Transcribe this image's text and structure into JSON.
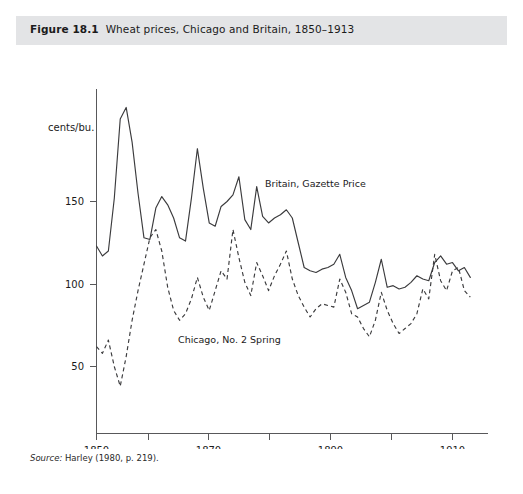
{
  "figure": {
    "number": "Figure 18.1",
    "caption": "Wheat prices, Chicago and Britain, 1850–1913",
    "source_label": "Source:",
    "source_text": " Harley (1980, p. 219)."
  },
  "labels": {
    "britain_series": "Britain, Gazette Price",
    "chicago_series": "Chicago, No. 2 Spring",
    "y_unit": "cents/bu."
  },
  "colors": {
    "header_band": "#e3e4e6",
    "panel_background": "#ffffff",
    "line": "#3b3b3d",
    "axis": "#58585a",
    "text": "#1b1b1b"
  },
  "chart_data": {
    "type": "line",
    "title": "Wheat prices, Chicago and Britain, 1850–1913",
    "xlabel": "",
    "ylabel": "cents/bu.",
    "xlim": [
      1850,
      1913
    ],
    "ylim": [
      25,
      215
    ],
    "grid": false,
    "legend_position": "inline-annotations",
    "xticks": [
      1850,
      1860,
      1870,
      1880,
      1890,
      1900,
      1910
    ],
    "xtick_labels": [
      "1850",
      "",
      "1870",
      "",
      "1890",
      "",
      "1910"
    ],
    "yticks": [
      50,
      100,
      150
    ],
    "ytick_labels": [
      "50",
      "100",
      "150"
    ],
    "x": [
      1850,
      1851,
      1852,
      1853,
      1854,
      1855,
      1856,
      1857,
      1858,
      1859,
      1860,
      1861,
      1862,
      1863,
      1864,
      1865,
      1866,
      1867,
      1868,
      1869,
      1870,
      1871,
      1872,
      1873,
      1874,
      1875,
      1876,
      1877,
      1878,
      1879,
      1880,
      1881,
      1882,
      1883,
      1884,
      1885,
      1886,
      1887,
      1888,
      1889,
      1890,
      1891,
      1892,
      1893,
      1894,
      1895,
      1896,
      1897,
      1898,
      1899,
      1900,
      1901,
      1902,
      1903,
      1904,
      1905,
      1906,
      1907,
      1908,
      1909,
      1910,
      1911,
      1912,
      1913
    ],
    "series": [
      {
        "name": "Britain, Gazette Price",
        "style": "solid",
        "values": [
          123,
          117,
          120,
          152,
          200,
          207,
          186,
          155,
          128,
          127,
          146,
          153,
          148,
          140,
          128,
          126,
          152,
          182,
          158,
          137,
          135,
          147,
          150,
          154,
          165,
          139,
          133,
          159,
          141,
          137,
          140,
          142,
          145,
          140,
          125,
          110,
          108,
          107,
          109,
          110,
          112,
          118,
          104,
          96,
          85,
          87,
          89,
          101,
          115,
          98,
          99,
          97,
          98,
          101,
          105,
          103,
          102,
          113,
          117,
          112,
          113,
          108,
          110,
          104
        ]
      },
      {
        "name": "Chicago, No. 2 Spring",
        "style": "dashed",
        "values": [
          62,
          58,
          66,
          50,
          38,
          56,
          78,
          96,
          112,
          128,
          133,
          120,
          98,
          84,
          78,
          82,
          91,
          104,
          92,
          84,
          96,
          108,
          103,
          133,
          116,
          101,
          93,
          113,
          105,
          96,
          105,
          112,
          120,
          103,
          93,
          86,
          80,
          85,
          88,
          87,
          86,
          103,
          95,
          82,
          80,
          73,
          68,
          78,
          95,
          84,
          76,
          70,
          73,
          76,
          82,
          97,
          91,
          118,
          102,
          96,
          108,
          110,
          96,
          92
        ]
      }
    ]
  }
}
